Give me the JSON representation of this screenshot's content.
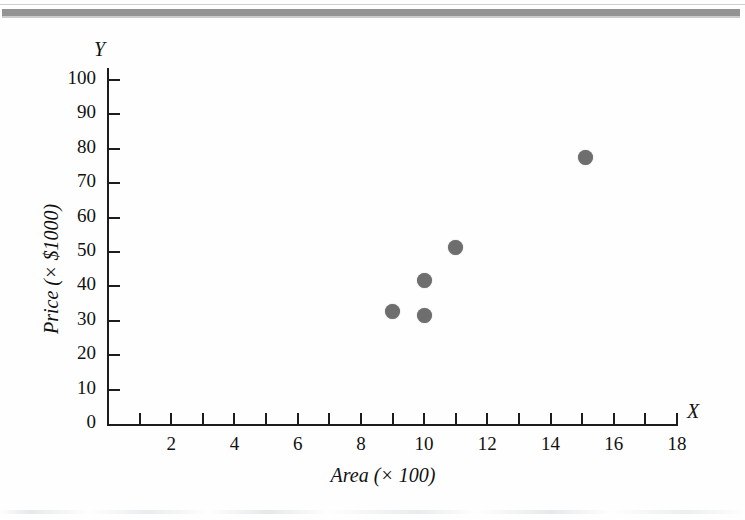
{
  "page": {
    "margin_glyphs": [
      "e",
      "s"
    ],
    "background_color": "#fefefe",
    "rule_color": "#8a8a8a"
  },
  "chart_data": {
    "type": "scatter",
    "title": "",
    "xlabel": "Area (× 100)",
    "ylabel": "Price (× $1000)",
    "x_axis_variable": "X",
    "y_axis_variable": "Y",
    "xlim": [
      0,
      18
    ],
    "ylim": [
      0,
      100
    ],
    "grid": false,
    "legend": null,
    "marker_color": "#6e6e6e",
    "x_tick_values": [
      0,
      1,
      2,
      3,
      4,
      5,
      6,
      7,
      8,
      9,
      10,
      11,
      12,
      13,
      14,
      15,
      16,
      17,
      18
    ],
    "x_tick_labels": [
      "2",
      "4",
      "6",
      "8",
      "10",
      "12",
      "14",
      "16",
      "18"
    ],
    "x_labeled_values": [
      2,
      4,
      6,
      8,
      10,
      12,
      14,
      16,
      18
    ],
    "y_tick_values": [
      0,
      10,
      20,
      30,
      40,
      50,
      60,
      70,
      80,
      90,
      100
    ],
    "y_tick_labels": [
      "0",
      "10",
      "20",
      "30",
      "40",
      "50",
      "60",
      "70",
      "80",
      "90",
      "100"
    ],
    "points": [
      {
        "x": 9.0,
        "y": 32.6
      },
      {
        "x": 10.0,
        "y": 31.5
      },
      {
        "x": 10.0,
        "y": 41.6
      },
      {
        "x": 11.0,
        "y": 51.3
      },
      {
        "x": 15.1,
        "y": 77.5
      }
    ]
  }
}
